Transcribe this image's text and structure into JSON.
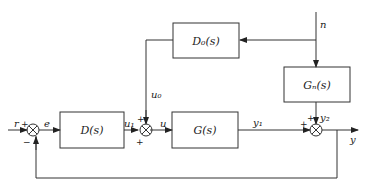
{
  "diagram": {
    "type": "control-block-diagram",
    "blocks": [
      {
        "id": "D",
        "label": "D(s)"
      },
      {
        "id": "G",
        "label": "G(s)"
      },
      {
        "id": "D0",
        "label": "D₀(s)"
      },
      {
        "id": "Gn",
        "label": "Gₙ(s)"
      }
    ],
    "signals": {
      "r": "r",
      "e": "e",
      "u1": "u₁",
      "u": "u",
      "u0": "u₀",
      "y1": "y₁",
      "y2": "y₂",
      "y": "y",
      "n": "n"
    },
    "signs": {
      "sum1_input": "+",
      "sum1_feedback": "−",
      "sum2_top": "+",
      "sum2_bottom": "+",
      "sum3_left": "+",
      "sum3_top": "+"
    }
  }
}
